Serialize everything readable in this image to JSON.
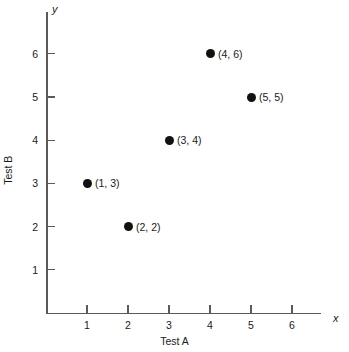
{
  "chart_data": {
    "type": "scatter",
    "title": "",
    "xlabel": "Test A",
    "ylabel": "Test B",
    "x_axis_symbol": "x",
    "y_axis_symbol": "y",
    "xlim": [
      0,
      6.6
    ],
    "ylim": [
      0,
      6.9
    ],
    "grid": false,
    "legend": null,
    "x_ticks": [
      "1",
      "2",
      "3",
      "4",
      "5",
      "6"
    ],
    "y_ticks": [
      "1",
      "2",
      "3",
      "4",
      "5",
      "6"
    ],
    "x_tick_values": [
      1,
      2,
      3,
      4,
      5,
      6
    ],
    "y_tick_values": [
      1,
      2,
      3,
      4,
      5,
      6
    ],
    "points": [
      {
        "x": 1,
        "y": 3,
        "label": "(1, 3)"
      },
      {
        "x": 2,
        "y": 2,
        "label": "(2, 2)"
      },
      {
        "x": 3,
        "y": 4,
        "label": "(3, 4)"
      },
      {
        "x": 4,
        "y": 6,
        "label": "(4, 6)"
      },
      {
        "x": 5,
        "y": 5,
        "label": "(5, 5)"
      }
    ],
    "marker": "filled-circle",
    "marker_color": "#111111",
    "axis_color": "#5a5a5a",
    "background_color": "#ffffff"
  }
}
